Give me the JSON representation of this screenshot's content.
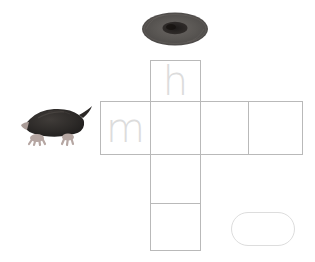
{
  "worksheet": {
    "title": "Mole word grid tracing worksheet",
    "background_color": "#ffffff",
    "grid_line_color": "#b9b9b9",
    "trace_letter_color": "#dcdcdc"
  },
  "grid": {
    "column_cells": [
      {
        "id": "cell-h",
        "letter": "h",
        "has_letter": true,
        "position": "column-row-1"
      },
      {
        "id": "cell-v2",
        "letter": "",
        "has_letter": false,
        "position": "column-row-2"
      },
      {
        "id": "cell-v3",
        "letter": "",
        "has_letter": false,
        "position": "column-row-3"
      },
      {
        "id": "cell-v4",
        "letter": "",
        "has_letter": false,
        "position": "column-row-4"
      }
    ],
    "row_cells": [
      {
        "id": "cell-m",
        "letter": "m",
        "has_letter": true,
        "position": "row-col-1"
      },
      {
        "id": "cell-h3",
        "letter": "",
        "has_letter": false,
        "position": "row-col-3"
      },
      {
        "id": "cell-h4",
        "letter": "",
        "has_letter": false,
        "position": "row-col-4"
      }
    ]
  },
  "answer_pill": {
    "label": "",
    "shape": "stadium",
    "border_color": "#dddddd"
  },
  "illustrations": [
    {
      "id": "mole-top",
      "name": "mole-top-view-image",
      "description": "top-down view of a dark mole",
      "body_color": "#53504e",
      "center_color": "#2b2826"
    },
    {
      "id": "mole-side",
      "name": "mole-side-view-image",
      "description": "side view of a dark mole with pink feet and tail",
      "body_color": "#2e2b29",
      "foot_color": "#b9a9a5"
    }
  ]
}
